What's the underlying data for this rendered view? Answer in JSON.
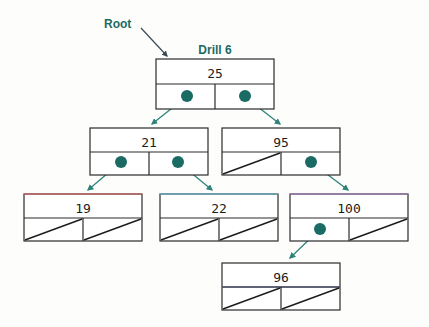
{
  "figure": {
    "title": "Drill 6",
    "root_label": "Root",
    "accent_color": "#1d6a62",
    "pointer_color": "#1a6b63",
    "arrow_color": "#2e8379",
    "box_stroke": "#2b2b2b",
    "background": "#fdfdfc"
  },
  "diagram": {
    "type": "binary-search-tree",
    "node_count": 7,
    "levels": 4,
    "nodes": [
      {
        "id": "n25",
        "key": "25",
        "level": 0,
        "x": 156,
        "y": 59,
        "w": 118,
        "h": 50,
        "left_pointer": "link",
        "right_pointer": "link",
        "top_tint": "none"
      },
      {
        "id": "n21",
        "key": "21",
        "level": 1,
        "x": 90,
        "y": 128,
        "w": 118,
        "h": 47,
        "left_pointer": "link",
        "right_pointer": "link",
        "top_tint": "none"
      },
      {
        "id": "n95",
        "key": "95",
        "level": 1,
        "x": 222,
        "y": 128,
        "w": 118,
        "h": 47,
        "left_pointer": "null",
        "right_pointer": "link",
        "top_tint": "none"
      },
      {
        "id": "n19",
        "key": "19",
        "level": 2,
        "x": 24,
        "y": 194,
        "w": 118,
        "h": 47,
        "left_pointer": "null",
        "right_pointer": "null",
        "top_tint": "red"
      },
      {
        "id": "n22",
        "key": "22",
        "level": 2,
        "x": 160,
        "y": 194,
        "w": 118,
        "h": 47,
        "left_pointer": "null",
        "right_pointer": "null",
        "top_tint": "cyan"
      },
      {
        "id": "n100",
        "key": "100",
        "level": 2,
        "x": 290,
        "y": 194,
        "w": 118,
        "h": 47,
        "left_pointer": "link",
        "right_pointer": "null",
        "top_tint": "purple"
      },
      {
        "id": "n96",
        "key": "96",
        "level": 3,
        "x": 222,
        "y": 263,
        "w": 118,
        "h": 47,
        "left_pointer": "null",
        "right_pointer": "null",
        "top_tint": "blue"
      }
    ],
    "edges": [
      {
        "id": "e25-21",
        "from": "n25",
        "from_side": "left",
        "to": "n21",
        "x1": 186,
        "y1": 97,
        "x2": 152,
        "y2": 124
      },
      {
        "id": "e25-95",
        "from": "n25",
        "from_side": "right",
        "to": "n95",
        "x1": 245,
        "y1": 97,
        "x2": 280,
        "y2": 124
      },
      {
        "id": "e21-19",
        "from": "n21",
        "from_side": "left",
        "to": "n19",
        "x1": 121,
        "y1": 162,
        "x2": 88,
        "y2": 190
      },
      {
        "id": "e21-22",
        "from": "n21",
        "from_side": "right",
        "to": "n22",
        "x1": 178,
        "y1": 162,
        "x2": 212,
        "y2": 190
      },
      {
        "id": "e95-100",
        "from": "n95",
        "from_side": "right",
        "to": "n100",
        "x1": 311,
        "y1": 162,
        "x2": 348,
        "y2": 190
      },
      {
        "id": "e100-96",
        "from": "n100",
        "from_side": "left",
        "to": "n96",
        "x1": 320,
        "y1": 229,
        "x2": 290,
        "y2": 258
      }
    ],
    "root_annotation": {
      "label": "Root",
      "text_x": 104,
      "text_y": 28,
      "arrow_x1": 141,
      "arrow_y1": 28,
      "arrow_x2": 167,
      "arrow_y2": 56
    },
    "title_position": {
      "x": 215,
      "y": 54
    }
  }
}
